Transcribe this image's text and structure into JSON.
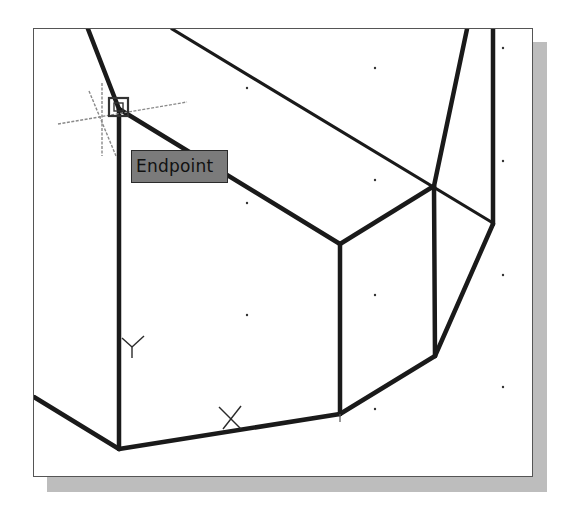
{
  "viewport": {
    "background": "#ffffff",
    "border_color": "#555555",
    "shadow_color": "#bdbdbd"
  },
  "snap_tooltip": {
    "label": "Endpoint",
    "background": "#7b7b7b"
  },
  "ucs_icon": {
    "y_label": "Y",
    "x_label": "X"
  },
  "drawing": {
    "line_color": "#1a1a1a",
    "crosshair_color": "#8a8a8a",
    "grid_dot_color": "#333333",
    "snap_marker": "endpoint-square"
  }
}
